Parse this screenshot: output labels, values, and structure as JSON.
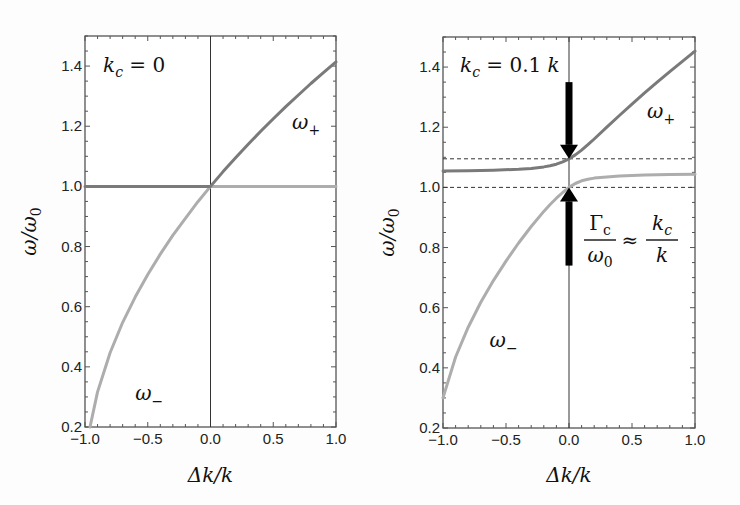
{
  "chart_data": [
    {
      "type": "line",
      "panel": "left",
      "annotation": "k_c = 0",
      "xlabel": "Δk/k",
      "ylabel": "ω/ω₀",
      "xlim": [
        -1.0,
        1.0
      ],
      "ylim": [
        0.2,
        1.5
      ],
      "xticks": [
        "−1.0",
        "−0.5",
        "0.0",
        "0.5",
        "1.0"
      ],
      "xtick_values": [
        -1.0,
        -0.5,
        0.0,
        0.5,
        1.0
      ],
      "yticks": [
        "0.2",
        "0.4",
        "0.6",
        "0.8",
        "1.0",
        "1.2",
        "1.4"
      ],
      "ytick_values": [
        0.2,
        0.4,
        0.6,
        0.8,
        1.0,
        1.2,
        1.4
      ],
      "grid": false,
      "vertical_line_x": 0.0,
      "series": [
        {
          "name": "ω+",
          "label_sub": "+",
          "color": "#7a7a7a",
          "x": [
            -1.0,
            -0.75,
            -0.5,
            -0.25,
            0.0,
            0.1,
            0.2,
            0.3,
            0.4,
            0.5,
            0.6,
            0.7,
            0.8,
            0.9,
            1.0
          ],
          "y": [
            1.0,
            1.0,
            1.0,
            1.0,
            1.0,
            1.049,
            1.095,
            1.14,
            1.183,
            1.225,
            1.265,
            1.304,
            1.342,
            1.378,
            1.414
          ]
        },
        {
          "name": "ω−",
          "label_sub": "−",
          "color": "#adadad",
          "x": [
            -0.96,
            -0.9,
            -0.8,
            -0.7,
            -0.6,
            -0.5,
            -0.4,
            -0.3,
            -0.2,
            -0.1,
            0.0,
            0.25,
            0.5,
            0.75,
            1.0
          ],
          "y": [
            0.2,
            0.316,
            0.447,
            0.548,
            0.632,
            0.707,
            0.775,
            0.837,
            0.894,
            0.949,
            1.0,
            1.0,
            1.0,
            1.0,
            1.0
          ]
        }
      ],
      "labels": [
        {
          "text": "ω+",
          "x": 0.65,
          "y": 1.19
        },
        {
          "text": "ω−",
          "x": -0.6,
          "y": 0.29
        }
      ]
    },
    {
      "type": "line",
      "panel": "right",
      "annotation": "k_c = 0.1 k",
      "xlabel": "Δk/k",
      "ylabel": "ω/ω₀",
      "xlim": [
        -1.0,
        1.0
      ],
      "ylim": [
        0.2,
        1.5
      ],
      "xticks": [
        "−1.0",
        "−0.5",
        "0.0",
        "0.5",
        "1.0"
      ],
      "xtick_values": [
        -1.0,
        -0.5,
        0.0,
        0.5,
        1.0
      ],
      "yticks": [
        "0.2",
        "0.4",
        "0.6",
        "0.8",
        "1.0",
        "1.2",
        "1.4"
      ],
      "ytick_values": [
        0.2,
        0.4,
        0.6,
        0.8,
        1.0,
        1.2,
        1.4
      ],
      "grid": false,
      "vertical_line_x": 0.0,
      "dashed_hlines": [
        1.0,
        1.095
      ],
      "arrows": [
        {
          "direction": "down",
          "x": 0.0,
          "from_y": 1.35,
          "to_y": 1.095
        },
        {
          "direction": "up",
          "x": 0.0,
          "from_y": 0.74,
          "to_y": 1.0
        }
      ],
      "formula": "Γc/ω0 ≈ kc/k",
      "series": [
        {
          "name": "ω+",
          "label_sub": "+",
          "color": "#7a7a7a",
          "x": [
            -1.0,
            -0.8,
            -0.6,
            -0.4,
            -0.3,
            -0.2,
            -0.15,
            -0.1,
            -0.05,
            0.0,
            0.05,
            0.1,
            0.15,
            0.2,
            0.3,
            0.4,
            0.5,
            0.6,
            0.7,
            0.8,
            0.9,
            1.0
          ],
          "y": [
            1.054,
            1.055,
            1.057,
            1.06,
            1.063,
            1.068,
            1.072,
            1.077,
            1.085,
            1.095,
            1.108,
            1.124,
            1.142,
            1.161,
            1.2,
            1.239,
            1.277,
            1.314,
            1.35,
            1.385,
            1.419,
            1.453
          ]
        },
        {
          "name": "ω−",
          "label_sub": "−",
          "color": "#adadad",
          "x": [
            -1.0,
            -0.9,
            -0.8,
            -0.7,
            -0.6,
            -0.5,
            -0.4,
            -0.3,
            -0.2,
            -0.15,
            -0.1,
            -0.05,
            0.0,
            0.05,
            0.1,
            0.15,
            0.2,
            0.3,
            0.4,
            0.6,
            0.8,
            1.0
          ],
          "y": [
            0.3,
            0.436,
            0.535,
            0.618,
            0.69,
            0.755,
            0.815,
            0.87,
            0.92,
            0.943,
            0.964,
            0.983,
            1.0,
            1.013,
            1.022,
            1.027,
            1.031,
            1.035,
            1.038,
            1.041,
            1.043,
            1.044
          ]
        }
      ],
      "labels": [
        {
          "text": "ω+",
          "x": 0.62,
          "y": 1.23
        },
        {
          "text": "ω−",
          "x": -0.63,
          "y": 0.47
        }
      ]
    }
  ]
}
